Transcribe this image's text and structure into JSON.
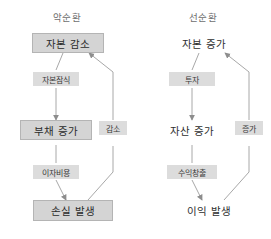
{
  "diagram": {
    "type": "flow-diagram",
    "background_color": "#ffffff",
    "node_box_color": "#d4d4d4",
    "edge_label_color": "#dcdcdc",
    "line_color": "#9a9a9a",
    "columns": [
      {
        "id": "vicious",
        "header": "악순환",
        "nodes": [
          {
            "id": "v1",
            "label": "자본 감소",
            "style": "boxed"
          },
          {
            "id": "v2",
            "label": "부채 증가",
            "style": "boxed"
          },
          {
            "id": "v3",
            "label": "손실 발생",
            "style": "boxed"
          }
        ],
        "edge_labels": [
          {
            "id": "ve1",
            "label": "자본잠식"
          },
          {
            "id": "ve2",
            "label": "이자비용"
          },
          {
            "id": "ve3",
            "label": "감소"
          }
        ]
      },
      {
        "id": "virtuous",
        "header": "선순환",
        "nodes": [
          {
            "id": "g1",
            "label": "자본 증가",
            "style": "plain"
          },
          {
            "id": "g2",
            "label": "자산 증가",
            "style": "plain"
          },
          {
            "id": "g3",
            "label": "이익 발생",
            "style": "plain"
          }
        ],
        "edge_labels": [
          {
            "id": "ge1",
            "label": "투자"
          },
          {
            "id": "ge2",
            "label": "수익창출"
          },
          {
            "id": "ge3",
            "label": "증가"
          }
        ]
      }
    ]
  }
}
